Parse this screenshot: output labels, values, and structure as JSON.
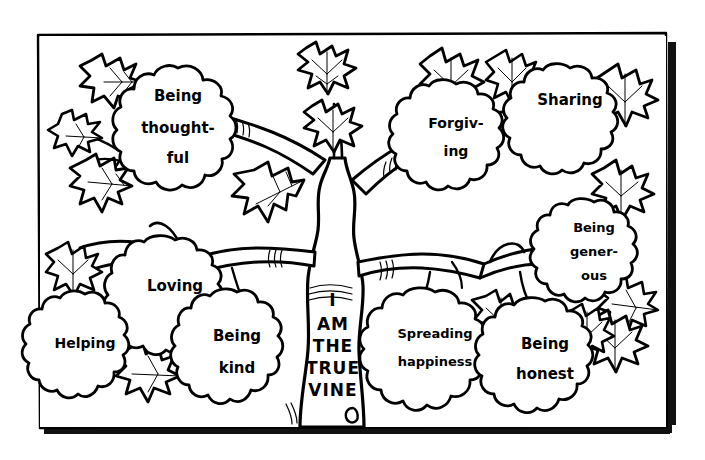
{
  "artwork": {
    "title": "I Am The True Vine",
    "style": "black-and-white line art coloring page",
    "background_color": "#ffffff",
    "ink_color": "#000000"
  },
  "frame": {
    "name": "hand-drawn rectangular border with drop shadow",
    "border_color": "#000000",
    "shadow_color": "#111111"
  },
  "trunk": {
    "label_lines": [
      "I",
      "AM",
      "THE",
      "TRUE",
      "VINE"
    ],
    "label_text": "I AM THE TRUE VINE"
  },
  "clusters": [
    {
      "id": "being-thoughtful",
      "label": "Being thought-ful",
      "lines": [
        "Being",
        "thought-",
        "ful"
      ],
      "position": "upper-left"
    },
    {
      "id": "forgiving",
      "label": "Forgiving",
      "lines": [
        "Forgiv-",
        "ing"
      ],
      "position": "upper-right-inner"
    },
    {
      "id": "sharing",
      "label": "Sharing",
      "lines": [
        "Sharing"
      ],
      "position": "upper-right"
    },
    {
      "id": "being-generous",
      "label": "Being generous",
      "lines": [
        "Being",
        "gener-",
        "ous"
      ],
      "position": "mid-right"
    },
    {
      "id": "loving",
      "label": "Loving",
      "lines": [
        "Loving"
      ],
      "position": "mid-left"
    },
    {
      "id": "helping",
      "label": "Helping",
      "lines": [
        "Helping"
      ],
      "position": "lower-left"
    },
    {
      "id": "being-kind",
      "label": "Being kind",
      "lines": [
        "Being",
        "kind"
      ],
      "position": "lower-left-inner"
    },
    {
      "id": "spreading-happiness",
      "label": "Spreading happiness",
      "lines": [
        "Spreading",
        "happiness"
      ],
      "position": "lower-right-inner"
    },
    {
      "id": "being-honest",
      "label": "Being honest",
      "lines": [
        "Being",
        "honest"
      ],
      "position": "lower-right"
    }
  ]
}
